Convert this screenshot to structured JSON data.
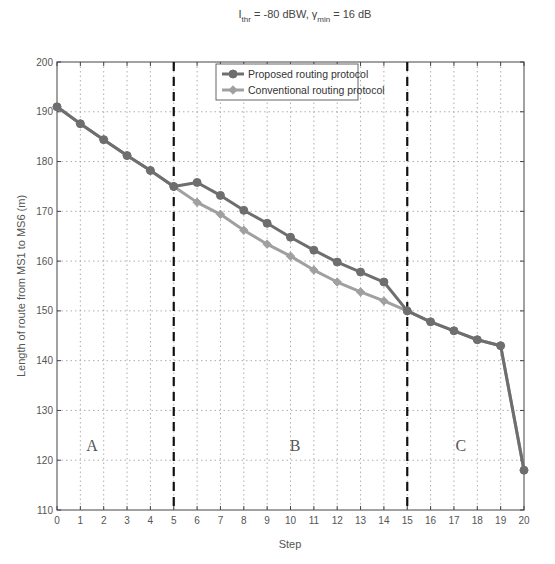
{
  "chart_data": {
    "type": "line",
    "title": {
      "prefix": "I",
      "prefix_sub": "thr",
      "middle": " = -80 dBW, γ",
      "middle_sub": "min",
      "suffix": " = 16 dB"
    },
    "title_text": "I_thr = -80 dBW, γ_min = 16 dB",
    "xlabel": "Step",
    "ylabel": "Length of route from MS1 to MS6 (m)",
    "xlim": [
      0,
      20
    ],
    "ylim": [
      110,
      200
    ],
    "xticks": [
      0,
      1,
      2,
      3,
      4,
      5,
      6,
      7,
      8,
      9,
      10,
      11,
      12,
      13,
      14,
      15,
      16,
      17,
      18,
      19,
      20
    ],
    "xtick_labels": [
      "0",
      "1",
      "2",
      "3",
      "4",
      "5",
      "6",
      "7",
      "8",
      "9",
      "10",
      "11",
      "12",
      "13",
      "14",
      "15",
      "16",
      "17",
      "18",
      "19",
      "20"
    ],
    "yticks": [
      110,
      120,
      130,
      140,
      150,
      160,
      170,
      180,
      190,
      200
    ],
    "ytick_labels": [
      "110",
      "120",
      "130",
      "140",
      "150",
      "160",
      "170",
      "180",
      "190",
      "200"
    ],
    "grid": true,
    "legend_position": "top-center",
    "x": [
      0,
      1,
      2,
      3,
      4,
      5,
      6,
      7,
      8,
      9,
      10,
      11,
      12,
      13,
      14,
      15,
      16,
      17,
      18,
      19,
      20
    ],
    "series": [
      {
        "name": "Proposed routing protocol",
        "color": "#6e6e6e",
        "marker": "circle",
        "values": [
          191,
          187.6,
          184.4,
          181.2,
          178.2,
          175,
          175.8,
          173.2,
          170.2,
          167.6,
          164.8,
          162.2,
          159.8,
          157.8,
          155.8,
          150,
          147.8,
          146,
          144.2,
          143,
          118
        ]
      },
      {
        "name": "Conventional routing protocol",
        "color": "#a0a0a0",
        "marker": "diamond",
        "values": [
          191,
          187.6,
          184.4,
          181.2,
          178.2,
          175,
          171.8,
          169.4,
          166.2,
          163.4,
          161,
          158.2,
          155.8,
          153.8,
          152,
          150,
          147.8,
          146,
          144.2,
          143,
          118
        ]
      }
    ],
    "vertical_dividers": [
      5,
      15
    ],
    "annotations": [
      {
        "text": "A",
        "x": 1.5,
        "y": 123
      },
      {
        "text": "B",
        "x": 10.2,
        "y": 123
      },
      {
        "text": "C",
        "x": 17.3,
        "y": 123
      }
    ]
  }
}
